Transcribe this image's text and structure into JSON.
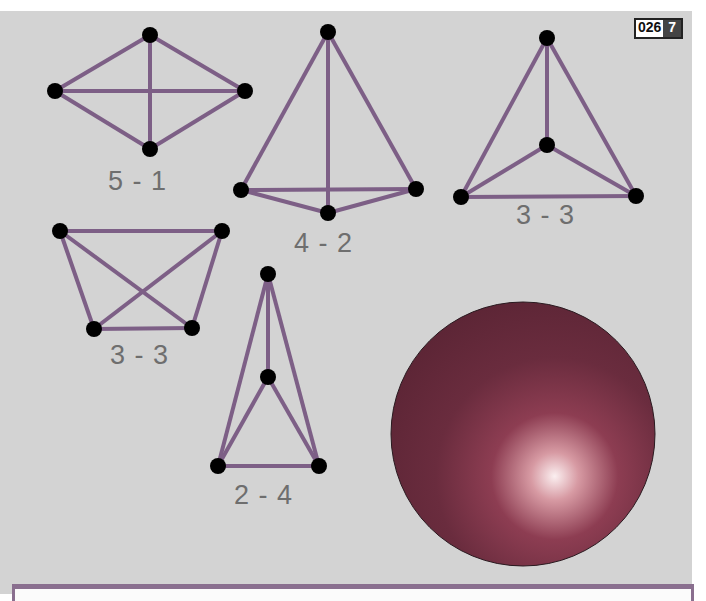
{
  "badge": {
    "code": "026",
    "page": "7"
  },
  "colors": {
    "background": "#d3d3d3",
    "edge": "#7d5f86",
    "vertex": "#000000",
    "sphere_dark": "#6a2c3c",
    "sphere_light": "#f6e8e8",
    "label": "#6e6e6e"
  },
  "graphs": [
    {
      "id": "g1",
      "label": "5 - 1"
    },
    {
      "id": "g2",
      "label": "4 - 2"
    },
    {
      "id": "g3",
      "label": "3 - 3"
    },
    {
      "id": "g4",
      "label": "3 - 3"
    },
    {
      "id": "g5",
      "label": "2 - 4"
    }
  ],
  "sphere": {
    "description": "shaded sphere"
  }
}
